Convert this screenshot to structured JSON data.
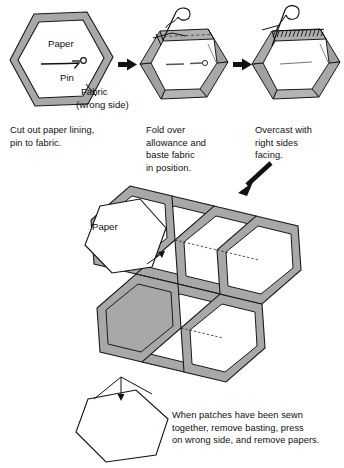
{
  "figure": {
    "type": "instructional-diagram",
    "width": 344,
    "height": 468,
    "background_color": "#ffffff",
    "ink_color": "#101010",
    "fabric_fill_color": "#a8a8a8",
    "fabric_fill_color_light": "#b4b4b4",
    "paper_fill_color": "#ffffff"
  },
  "steps": [
    {
      "index": 1,
      "caption": "Cut out paper lining,\npin to fabric.",
      "labels": {
        "paper": "Paper",
        "pin": "Pin",
        "fabric": "Fabric",
        "fabric_side": "(wrong side)"
      }
    },
    {
      "index": 2,
      "caption": "Fold over\nallowance and\nbaste fabric\nin position."
    },
    {
      "index": 3,
      "caption": "Overcast with\nright sides\nfacing."
    }
  ],
  "arrows": {
    "step1_to_step2": "arrow-right",
    "step2_to_step3": "arrow-right",
    "step3_to_cluster": "arrow-down-left"
  },
  "cluster": {
    "paper_label": "Paper",
    "caption": "When patches have been sewn\ntogether, remove basting, press\non wrong side, and remove papers.",
    "hexagon_count": 7,
    "loose_paper_hexagons": 2
  }
}
